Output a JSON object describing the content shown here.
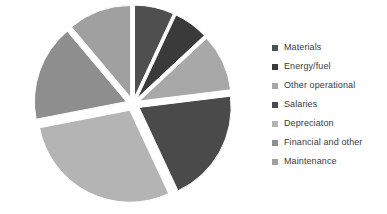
{
  "chart_data": {
    "type": "pie",
    "title": "",
    "subtitle": "",
    "xlabel": "",
    "ylabel": "",
    "grid": false,
    "legend_position": "right",
    "exploded": true,
    "start_angle_deg": 0,
    "categories": [
      "Materials",
      "Energy/fuel",
      "Other operational",
      "Salaries",
      "Depreciaton",
      "Financial and other",
      "Maintenance"
    ],
    "values": [
      7,
      6,
      10,
      20,
      29,
      17,
      11
    ],
    "colors": [
      "#4f4f4f",
      "#3a3a3a",
      "#a8a8a8",
      "#4a4a4a",
      "#b4b4b4",
      "#8e8e8e",
      "#a0a0a0"
    ],
    "slices": [
      {
        "label": "Materials",
        "value": 7,
        "color": "#4f4f4f",
        "start_deg": 0,
        "end_deg": 25
      },
      {
        "label": "Energy/fuel",
        "value": 6,
        "color": "#3a3a3a",
        "start_deg": 25,
        "end_deg": 47
      },
      {
        "label": "Other operational",
        "value": 10,
        "color": "#a8a8a8",
        "start_deg": 47,
        "end_deg": 83
      },
      {
        "label": "Salaries",
        "value": 20,
        "color": "#4a4a4a",
        "start_deg": 83,
        "end_deg": 155
      },
      {
        "label": "Depreciaton",
        "value": 29,
        "color": "#b4b4b4",
        "start_deg": 155,
        "end_deg": 259
      },
      {
        "label": "Financial and other",
        "value": 17,
        "color": "#8e8e8e",
        "start_deg": 259,
        "end_deg": 320
      },
      {
        "label": "Maintenance",
        "value": 11,
        "color": "#a0a0a0",
        "start_deg": 320,
        "end_deg": 360
      }
    ]
  },
  "legend": {
    "items": [
      {
        "label": "Materials",
        "color": "#4f4f4f"
      },
      {
        "label": "Energy/fuel",
        "color": "#3a3a3a"
      },
      {
        "label": "Other operational",
        "color": "#a8a8a8"
      },
      {
        "label": "Salaries",
        "color": "#4a4a4a"
      },
      {
        "label": "Depreciaton",
        "color": "#b4b4b4"
      },
      {
        "label": "Financial and other",
        "color": "#8e8e8e"
      },
      {
        "label": "Maintenance",
        "color": "#a0a0a0"
      }
    ]
  }
}
